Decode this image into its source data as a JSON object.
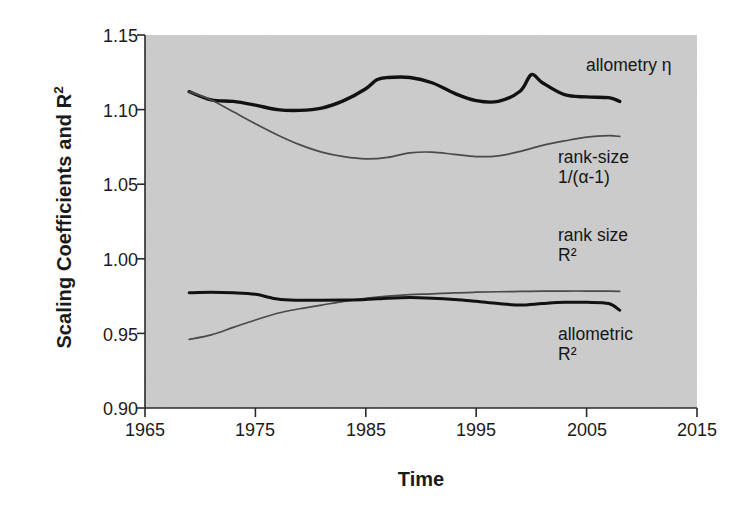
{
  "chart_data": {
    "type": "line",
    "title": "",
    "xlabel": "Time",
    "ylabel": "Scaling Coefficients and R²",
    "xlim": [
      1965,
      2015
    ],
    "ylim": [
      0.9,
      1.15
    ],
    "xticks": [
      "1965",
      "1975",
      "1985",
      "1995",
      "2005",
      "2015"
    ],
    "xtick_values": [
      1965,
      1975,
      1985,
      1995,
      2005,
      2015
    ],
    "yticks": [
      "0.90",
      "0.95",
      "1.00",
      "1.05",
      "1.10",
      "1.15"
    ],
    "ytick_values": [
      0.9,
      0.95,
      1.0,
      1.05,
      1.1,
      1.15
    ],
    "grid": false,
    "legend_position": "inline-annotations",
    "plot_background": "#d4d4d4",
    "figure_background": "#ffffff",
    "axis_color": "#2a2a2a",
    "series": [
      {
        "name": "allometry η",
        "label_lines": [
          "allometry η"
        ],
        "color": "#111111",
        "width": 3.4,
        "x": [
          1969,
          1971,
          1973,
          1975,
          1977,
          1979,
          1981,
          1983,
          1985,
          1986,
          1987,
          1989,
          1991,
          1993,
          1995,
          1997,
          1999,
          2000,
          2001,
          2003,
          2005,
          2007,
          2008
        ],
        "values": [
          1.112,
          1.1065,
          1.1055,
          1.103,
          1.1,
          1.0995,
          1.101,
          1.106,
          1.114,
          1.12,
          1.1215,
          1.1215,
          1.118,
          1.111,
          1.106,
          1.1055,
          1.1125,
          1.1235,
          1.118,
          1.11,
          1.1085,
          1.108,
          1.1055
        ]
      },
      {
        "name": "rank-size 1/(α-1)",
        "label_lines": [
          "rank-size",
          "1/(α-1)"
        ],
        "color": "#4a4a4a",
        "width": 1.7,
        "x": [
          1969,
          1971,
          1973,
          1975,
          1977,
          1979,
          1981,
          1983,
          1985,
          1987,
          1989,
          1991,
          1993,
          1995,
          1997,
          1999,
          2001,
          2003,
          2005,
          2007,
          2008
        ],
        "values": [
          1.112,
          1.1065,
          1.0985,
          1.0905,
          1.083,
          1.0765,
          1.0715,
          1.0685,
          1.067,
          1.068,
          1.071,
          1.0715,
          1.07,
          1.0685,
          1.069,
          1.072,
          1.076,
          1.079,
          1.0815,
          1.0825,
          1.082
        ]
      },
      {
        "name": "rank size R²",
        "label_lines": [
          "rank size",
          "R²"
        ],
        "color": "#4a4a4a",
        "width": 1.7,
        "x": [
          1969,
          1971,
          1973,
          1975,
          1977,
          1979,
          1981,
          1983,
          1985,
          1987,
          1989,
          1991,
          1993,
          1995,
          1997,
          1999,
          2001,
          2003,
          2005,
          2007,
          2008
        ],
        "values": [
          0.946,
          0.949,
          0.954,
          0.959,
          0.9635,
          0.9665,
          0.969,
          0.9715,
          0.9735,
          0.975,
          0.976,
          0.9765,
          0.9772,
          0.9776,
          0.9779,
          0.9781,
          0.9783,
          0.9784,
          0.9784,
          0.9783,
          0.9782
        ]
      },
      {
        "name": "allometric R²",
        "label_lines": [
          "allometric",
          "R²"
        ],
        "color": "#111111",
        "width": 3.0,
        "x": [
          1969,
          1971,
          1973,
          1975,
          1977,
          1979,
          1981,
          1983,
          1985,
          1987,
          1989,
          1991,
          1993,
          1995,
          1997,
          1999,
          2001,
          2003,
          2005,
          2007,
          2008
        ],
        "values": [
          0.9772,
          0.9775,
          0.9772,
          0.9762,
          0.973,
          0.9722,
          0.9722,
          0.9724,
          0.9728,
          0.9736,
          0.974,
          0.9736,
          0.9728,
          0.9715,
          0.97,
          0.969,
          0.97,
          0.9708,
          0.9708,
          0.97,
          0.9655
        ]
      }
    ],
    "annotations": [
      {
        "name": "allometry-eta-label",
        "text": "allometry η",
        "x_px": 586,
        "y_px": 64
      },
      {
        "name": "rank-size-alpha-label",
        "text": "rank-size\n1/(α-1)",
        "x_px": 558,
        "y_px": 156
      },
      {
        "name": "rank-size-r2-label",
        "text": "rank size\nR²",
        "x_px": 558,
        "y_px": 234
      },
      {
        "name": "allometric-r2-label",
        "text": "allometric\nR²",
        "x_px": 558,
        "y_px": 333
      }
    ]
  }
}
